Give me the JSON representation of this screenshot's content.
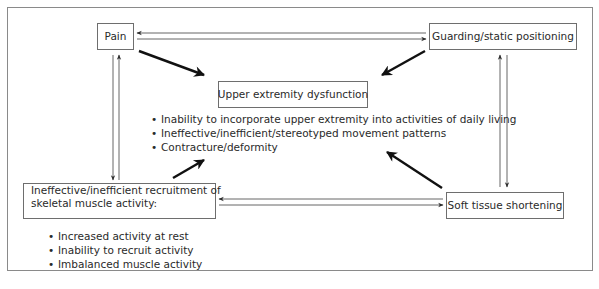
{
  "diagram": {
    "nodes": {
      "pain": {
        "label": "Pain"
      },
      "guarding": {
        "label": "Guarding/static positioning"
      },
      "upper_extremity": {
        "label": "Upper extremity dysfunction",
        "bullets": [
          "Inability to incorporate upper extremity into activities of daily living",
          "Ineffective/inefficient/stereotyped movement patterns",
          "Contracture/deformity"
        ]
      },
      "recruitment": {
        "label_line1": "Ineffective/inefficient recruitment of",
        "label_line2": "skeletal muscle activity:",
        "bullets": [
          "Increased activity at rest",
          "Inability to recruit activity",
          "Imbalanced muscle activity"
        ]
      },
      "soft_tissue": {
        "label": "Soft tissue shortening"
      }
    },
    "edges": [
      {
        "from": "Pain",
        "to": "Guarding/static positioning",
        "style": "thin",
        "bidirectional": true
      },
      {
        "from": "Pain",
        "to": "Ineffective/inefficient recruitment of skeletal muscle activity",
        "style": "thin",
        "bidirectional": true
      },
      {
        "from": "Guarding/static positioning",
        "to": "Soft tissue shortening",
        "style": "thin",
        "bidirectional": true
      },
      {
        "from": "Ineffective/inefficient recruitment of skeletal muscle activity",
        "to": "Soft tissue shortening",
        "style": "thin",
        "bidirectional": true
      },
      {
        "from": "Pain",
        "to": "Upper extremity dysfunction",
        "style": "bold"
      },
      {
        "from": "Guarding/static positioning",
        "to": "Upper extremity dysfunction",
        "style": "bold"
      },
      {
        "from": "Ineffective/inefficient recruitment of skeletal muscle activity",
        "to": "Upper extremity dysfunction",
        "style": "bold"
      },
      {
        "from": "Soft tissue shortening",
        "to": "Upper extremity dysfunction",
        "style": "bold"
      }
    ]
  }
}
